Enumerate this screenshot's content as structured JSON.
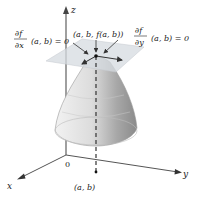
{
  "diagram": {
    "axes": {
      "x_label": "x",
      "y_label": "y",
      "z_label": "z",
      "origin_label": "0"
    },
    "point_label": "(a, b, f(a, b))",
    "base_point_label": "(a, b)",
    "partial_x": {
      "numerator": "∂f",
      "denominator": "∂x",
      "rest": "(a, b) = 0"
    },
    "partial_y": {
      "numerator": "∂f",
      "denominator": "∂y",
      "rest": "(a, b) = 0"
    },
    "colors": {
      "surface_light": "#e6e6e6",
      "surface_dark": "#8c8c8c",
      "plane": "#d9dde0",
      "axis": "#555555",
      "text": "#222222"
    }
  }
}
